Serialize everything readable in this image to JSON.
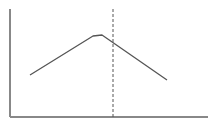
{
  "chart_data": {
    "type": "line",
    "title": "",
    "xlabel": "",
    "ylabel": "",
    "grid": false,
    "legend": null,
    "series": [
      {
        "name": "curve",
        "points": [
          [
            30,
            75
          ],
          [
            93,
            36
          ],
          [
            102,
            35
          ],
          [
            167,
            80
          ]
        ],
        "color": "#555555"
      }
    ],
    "annotations": [
      {
        "type": "vertical-dashed-line",
        "x": 113,
        "y_top": 9,
        "y_bottom": 117,
        "color": "#555555"
      }
    ],
    "axes": {
      "origin": [
        10,
        117
      ],
      "y_top": 9,
      "x_right": 208,
      "color": "#888888"
    }
  }
}
